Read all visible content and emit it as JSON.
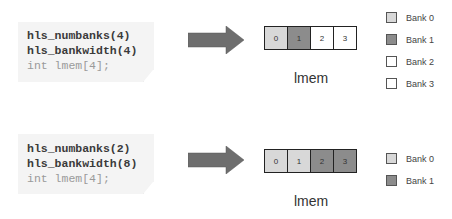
{
  "colors": {
    "bank0": "#d8d8d8",
    "bank1": "#8c8c8c",
    "bank2": "#ffffff",
    "bank3": "#ffffff",
    "arrow": "#6e6e6e",
    "code_bg": "#f4f4f4"
  },
  "examples": [
    {
      "code": {
        "line1": "hls_numbanks(4)",
        "line2": "hls_bankwidth(4)",
        "line3": "int lmem[4];"
      },
      "array": {
        "cells": [
          {
            "label": "0",
            "bank": 0
          },
          {
            "label": "1",
            "bank": 1
          },
          {
            "label": "2",
            "bank": 2
          },
          {
            "label": "3",
            "bank": 3
          }
        ],
        "caption": "lmem"
      },
      "legend": [
        {
          "label": "Bank 0"
        },
        {
          "label": "Bank 1"
        },
        {
          "label": "Bank 2"
        },
        {
          "label": "Bank 3"
        }
      ]
    },
    {
      "code": {
        "line1": "hls_numbanks(2)",
        "line2": "hls_bankwidth(8)",
        "line3": "int lmem[4];"
      },
      "array": {
        "cells": [
          {
            "label": "0",
            "bank": 0
          },
          {
            "label": "1",
            "bank": 0
          },
          {
            "label": "2",
            "bank": 1
          },
          {
            "label": "3",
            "bank": 1
          }
        ],
        "caption": "lmem"
      },
      "legend": [
        {
          "label": "Bank 0"
        },
        {
          "label": "Bank 1"
        }
      ]
    }
  ]
}
